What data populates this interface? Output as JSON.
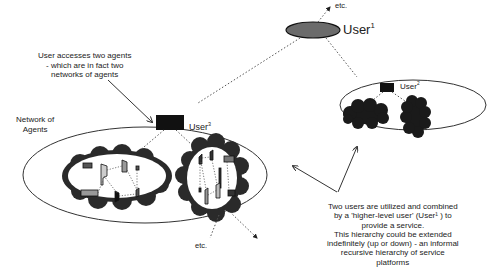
{
  "diagram": {
    "user1": {
      "label": "User",
      "superscript": "1"
    },
    "user2": {
      "label": "User",
      "superscript": "2"
    },
    "user3": {
      "label": "User",
      "superscript": "3"
    },
    "etc_top": "etc.",
    "etc_bottom": "etc.",
    "network_label_line1": "Network of",
    "network_label_line2": "Agents",
    "annotation_top": [
      "User accesses two agents",
      "- which are in fact two",
      "networks of agents"
    ],
    "annotation_bottom": [
      "Two users are utilized and combined",
      "by a 'higher-level user'  (User¹ ) to",
      "provide a service.",
      "This hierarchy could be extended",
      "indefinitely  (up or down) - an informal",
      "recursive hierarchy of service",
      "platforms"
    ],
    "colors": {
      "user1_fill": "#6b6b6b",
      "user_box": "#111111",
      "cloud": "#2a2a2a",
      "agent_fill": "#8a8a8a"
    }
  }
}
